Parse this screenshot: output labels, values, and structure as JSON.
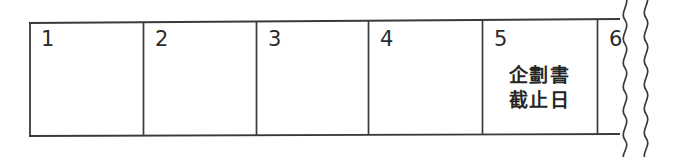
{
  "figure": {
    "kind": "hand-drawn-calendar-strip",
    "ink_color": "#333333",
    "background_color": "#ffffff",
    "edge_marker": {
      "name": "wavy-cut-line",
      "lines": 2,
      "orientation": "vertical"
    }
  },
  "calendar": {
    "days": [
      {
        "number": "1",
        "note_lines": []
      },
      {
        "number": "2",
        "note_lines": []
      },
      {
        "number": "3",
        "note_lines": []
      },
      {
        "number": "4",
        "note_lines": []
      },
      {
        "number": "5",
        "note_lines": [
          "企劃書",
          "截止日"
        ]
      },
      {
        "number": "6",
        "note_lines": []
      }
    ]
  }
}
